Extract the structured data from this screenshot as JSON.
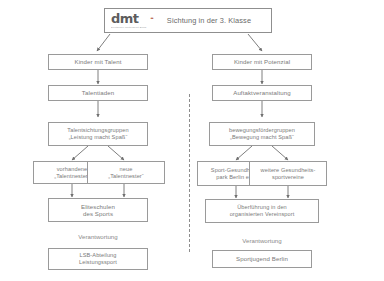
{
  "header": {
    "logo_wordmark": "dmt",
    "logo_dots": "••",
    "logo_subtext": "Deutscher Motorsport Bund",
    "title": "Sichtung in der 3. Klasse"
  },
  "divider": {
    "style": "dashed",
    "orientation": "vertical"
  },
  "colors": {
    "box_border": "#9a9a9a",
    "text": "#7a7a7a",
    "arrow": "#6f6f6f",
    "logo_accent": "#b05a3c",
    "background": "#ffffff"
  },
  "left_column": {
    "nodes": [
      {
        "id": "kinder-mit-talent",
        "lines": [
          "Kinder mit Talent"
        ]
      },
      {
        "id": "talentiaden",
        "lines": [
          "Talentiaden"
        ]
      },
      {
        "id": "talentsichtungsgruppen",
        "lines": [
          "Talentsichtungsgruppen",
          "„Leistung macht Spaß“"
        ]
      },
      {
        "id": "vorhandene-talentnester",
        "lines": [
          "vorhandene",
          "„Talentnester“"
        ]
      },
      {
        "id": "neue-talentnester",
        "lines": [
          "neue",
          "„Talentnester“"
        ]
      },
      {
        "id": "eliteschulen-des-sports",
        "lines": [
          "Eliteschulen",
          "des Sports"
        ]
      },
      {
        "id": "lsb-abteilung",
        "lines": [
          "LSB-Abteilung",
          "Leistungssport"
        ]
      }
    ],
    "responsibility_label": "Verantwortung"
  },
  "right_column": {
    "nodes": [
      {
        "id": "kinder-mit-potenzial",
        "lines": [
          "Kinder mit Potenzial"
        ]
      },
      {
        "id": "auftaktveranstaltung",
        "lines": [
          "Auftaktveranstaltung"
        ]
      },
      {
        "id": "bewegungsfoerdergruppen",
        "lines": [
          "bewegungsfördergruppen",
          "„Bewegung macht Spaß“"
        ]
      },
      {
        "id": "sport-gesundheitspark",
        "lines": [
          "Sport-Gesundheits-",
          "park Berlin e.V."
        ]
      },
      {
        "id": "weitere-gesundheitssportvereine",
        "lines": [
          "weitere Gesundheits-",
          "sportvereine"
        ]
      },
      {
        "id": "ueberfuehrung-vereinsport",
        "lines": [
          "Überführung in den",
          "organisierten Vereinsport"
        ]
      },
      {
        "id": "sportjugend-berlin",
        "lines": [
          "Sportjugend Berlin"
        ]
      }
    ],
    "responsibility_label": "Verantwortung"
  }
}
